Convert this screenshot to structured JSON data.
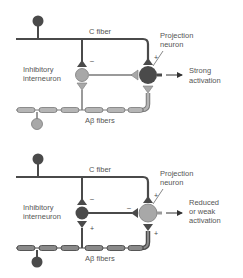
{
  "colors": {
    "dark_neuron": "#4a4a4a",
    "light_neuron": "#a8a8a8",
    "fiber_line": "#4a4a4a",
    "abeta_segment_fill": "#b5b5b5",
    "abeta_segment_stroke": "#6a6a6a",
    "text": "#555555"
  },
  "panels": [
    {
      "id": "top",
      "labels": {
        "c_fiber": "C fiber",
        "projection_neuron_line1": "Projection",
        "projection_neuron_line2": "neuron",
        "interneuron_line1": "Inhibitory",
        "interneuron_line2": "interneuron",
        "abeta_fibers": "Aβ fibers",
        "output_line1": "Strong",
        "output_line2": "activation"
      },
      "signs": {
        "c_to_interneuron": "–",
        "c_to_projection": "+"
      },
      "interneuron_state": "inactive (light)",
      "projection_state": "active (dark)"
    },
    {
      "id": "bottom",
      "labels": {
        "c_fiber": "C fiber",
        "projection_neuron_line1": "Projection",
        "projection_neuron_line2": "neuron",
        "interneuron_line1": "Inhibitory",
        "interneuron_line2": "interneuron",
        "abeta_fibers": "Aβ fibers",
        "output_line1": "Reduced",
        "output_line2": "or weak",
        "output_line3": "activation"
      },
      "signs": {
        "c_to_interneuron": "–",
        "abeta_to_interneuron": "+",
        "interneuron_to_projection": "–",
        "c_to_projection": "+",
        "abeta_to_projection": "+"
      },
      "interneuron_state": "active (dark)",
      "projection_state": "reduced (light)"
    }
  ]
}
